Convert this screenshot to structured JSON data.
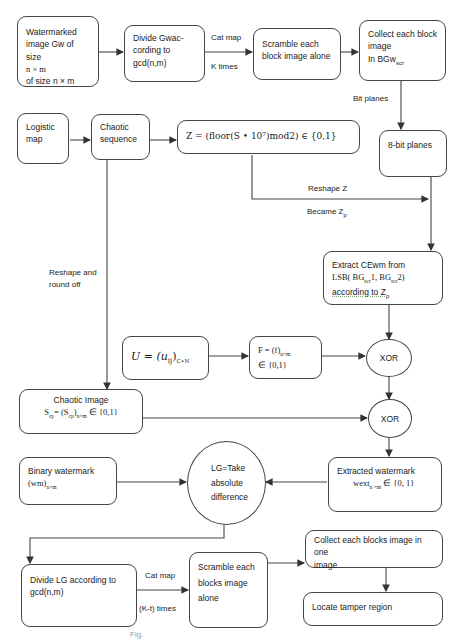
{
  "diagram": {
    "nodes": {
      "watermarked": {
        "lines": [
          "Watermarked",
          "image Gw of size",
          "n × m",
          "of size n × m"
        ]
      },
      "divide_gw": {
        "lines": [
          "Divide Gwac-",
          "cording to",
          "gcd(n,m)"
        ]
      },
      "scramble_top": {
        "lines": [
          "Scramble each",
          "block image alone"
        ]
      },
      "collect_top": {
        "lines": [
          "Collect each block",
          "image",
          "In BGw"
        ],
        "subscript": "scr"
      },
      "logistic": {
        "lines": [
          "Logistic",
          "map"
        ]
      },
      "chaotic_seq": {
        "lines": [
          "Chaotic",
          "sequence"
        ]
      },
      "z_formula": {
        "text": "Z = (floor(S • 10⁷)mod2) ∈ {0,1}"
      },
      "bit_planes": {
        "text": "8-bit planes"
      },
      "extract_cewm": {
        "line1": "Extract CEwm  from",
        "line2": "LSB( BG",
        "line2_sub1": "scr",
        "line2_mid": "1, BG",
        "line2_sub2": "scr",
        "line2_end": "2)",
        "line3": "according to Z",
        "line3_sub": "p"
      },
      "u_matrix": {
        "text": "U = (u",
        "sub_ij": "ij",
        "close": ")",
        "sub_cn": "C∗N"
      },
      "f_matrix": {
        "line1": "F = (f)",
        "line1_sub": "n×m",
        "line2": "∈ {0,1}"
      },
      "xor1": {
        "text": "XOR"
      },
      "xor2": {
        "text": "XOR"
      },
      "chaotic_image": {
        "title": "Chaotic Image",
        "formula_a": "S",
        "sub_a": "cp",
        "formula_b": "= (S",
        "sub_b": "cp",
        "formula_c": ")",
        "sub_c": "n×m",
        "formula_d": " ∈ {0,1}"
      },
      "binary_wm": {
        "line1": "Binary watermark",
        "line2": "(wm)",
        "line2_sub": "n×m"
      },
      "lg_circle": {
        "lines": [
          "LG=Take",
          "absolute",
          "difference"
        ]
      },
      "extracted_wm": {
        "line1": "Extracted watermark",
        "line2": "wext",
        "line2_sub": "n ×m",
        "line2_end": " ∈ {0, 1}"
      },
      "divide_lg": {
        "lines": [
          "Divide LG according to",
          "gcd(n,m)"
        ]
      },
      "scramble_bottom": {
        "lines": [
          "Scramble each",
          "blocks image",
          "alone"
        ]
      },
      "collect_bottom": {
        "lines": [
          "Collect each blocks image in one",
          "image"
        ]
      },
      "locate": {
        "text": "Locate tamper region"
      }
    },
    "edge_labels": {
      "cat_map_top": "Cat map",
      "k_times": "K times",
      "bit_planes": "Bit planes",
      "reshape_z": "Reshape Z",
      "became_zp": "Became Z",
      "became_zp_sub": "p",
      "reshape_round": [
        "Reshape and",
        "round off"
      ],
      "cat_map_bottom": "Cat map",
      "k_t_times": "(K-t) times"
    },
    "caption": "Fig."
  }
}
